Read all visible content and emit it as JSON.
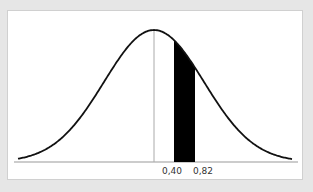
{
  "chart_data": {
    "type": "area",
    "title": "",
    "distribution": "normal",
    "mean": 0,
    "sd": 1,
    "shaded_interval": [
      0.4,
      0.82
    ],
    "x_tick_labels": [
      "0,40",
      "0,82"
    ],
    "mean_line": true,
    "xlabel": "",
    "ylabel": "",
    "grid": false
  },
  "colors": {
    "curve": "#111111",
    "shade": "#000000",
    "mean_line": "#aaaaaa",
    "background": "#e6e6e6",
    "panel": "#ffffff"
  }
}
